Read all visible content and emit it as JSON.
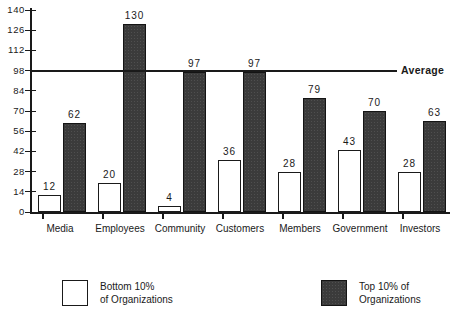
{
  "chart_data": {
    "type": "bar",
    "title": "",
    "xlabel": "",
    "ylabel": "",
    "ylim": [
      0,
      140
    ],
    "yticks": [
      0,
      14,
      28,
      42,
      56,
      70,
      84,
      98,
      112,
      126,
      140
    ],
    "grid": false,
    "legend_position": "bottom",
    "categories": [
      "Media",
      "Employees",
      "Community",
      "Customers",
      "Members",
      "Government",
      "Investors"
    ],
    "series": [
      {
        "name": "Bottom 10% of Organizations",
        "color": "#ffffff",
        "values": [
          12,
          20,
          4,
          36,
          28,
          43,
          28
        ]
      },
      {
        "name": "Top 10% of Organizations",
        "color": "#3b3b3b",
        "values": [
          62,
          130,
          97,
          97,
          79,
          70,
          63
        ]
      }
    ],
    "annotations": [
      {
        "name": "average-line",
        "label": "Average",
        "value": 98,
        "orientation": "horizontal"
      }
    ]
  },
  "legend": {
    "entries": [
      {
        "label_line1": "Bottom 10%",
        "label_line2": "of Organizations",
        "swatch": "hollow-square-swatch"
      },
      {
        "label_line1": "Top 10% of",
        "label_line2": "Organizations",
        "swatch": "filled-square-swatch"
      }
    ]
  }
}
